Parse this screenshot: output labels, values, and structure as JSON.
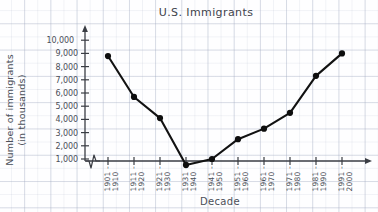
{
  "chart_data": {
    "type": "line",
    "title": "U.S. Immigrants",
    "xlabel": "Decade",
    "ylabel": "Number of immigrants (in thousands)",
    "ylabel_line1": "Number of immigrants",
    "ylabel_line2": "(in thousands)",
    "categories": [
      "1901 - 1910",
      "1911 - 1920",
      "1921 - 1930",
      "1931 - 1940",
      "1941 - 1950",
      "1951 - 1960",
      "1961 - 1970",
      "1971 - 1980",
      "1981 - 1990",
      "1991 - 2000"
    ],
    "category_parts": [
      [
        "1901 -",
        "1910"
      ],
      [
        "1911 -",
        "1920"
      ],
      [
        "1921 -",
        "1930"
      ],
      [
        "1931 -",
        "1940"
      ],
      [
        "1941 -",
        "1950"
      ],
      [
        "1951 -",
        "1960"
      ],
      [
        "1961 -",
        "1970"
      ],
      [
        "1971 -",
        "1980"
      ],
      [
        "1981 -",
        "1990"
      ],
      [
        "1991 -",
        "2000"
      ]
    ],
    "values": [
      8800,
      5700,
      4100,
      550,
      1000,
      2500,
      3300,
      4500,
      7300,
      9000
    ],
    "ytick_labels": [
      "1,000",
      "2,000",
      "3,000",
      "4,000",
      "5,000",
      "6,000",
      "7,000",
      "8,000",
      "9,000",
      "10,000"
    ],
    "ytick_values": [
      1000,
      2000,
      3000,
      4000,
      5000,
      6000,
      7000,
      8000,
      9000,
      10000
    ],
    "ylim": [
      0,
      10400
    ],
    "grid": true,
    "legend": "none",
    "axis_break": "x-axis zigzag near origin",
    "line_color": "#111111",
    "marker_color": "#111111",
    "grid_color": "#96a0b9",
    "text_color": "#4b4f58"
  }
}
